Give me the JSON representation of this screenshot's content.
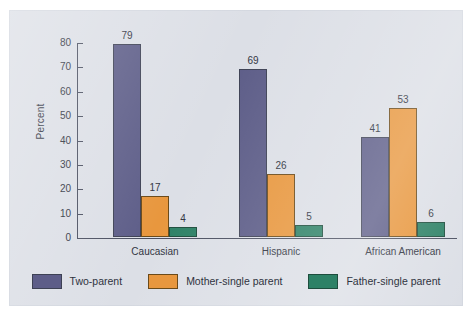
{
  "chart_data": {
    "type": "bar",
    "title": "",
    "xlabel": "",
    "ylabel": "Percent",
    "ylim": [
      0,
      80
    ],
    "yticks": [
      0,
      10,
      20,
      30,
      40,
      50,
      60,
      70,
      80
    ],
    "grid": false,
    "legend_position": "bottom",
    "categories": [
      "Caucasian",
      "Hispanic",
      "African American"
    ],
    "series": [
      {
        "name": "Two-parent",
        "color": "#5d5d88",
        "values": [
          79,
          69,
          41
        ]
      },
      {
        "name": "Mother-single parent",
        "color": "#e8973e",
        "values": [
          17,
          26,
          53
        ]
      },
      {
        "name": "Father-single parent",
        "color": "#2d8166",
        "values": [
          4,
          5,
          6
        ]
      }
    ],
    "data_labels": [
      [
        "79",
        "17",
        "4"
      ],
      [
        "69",
        "26",
        "5"
      ],
      [
        "41",
        "53",
        "6"
      ]
    ]
  },
  "figure": {
    "panel_background": "#dcdfe6",
    "axis_color": "#4a4f60",
    "text_color": "#2f3340"
  }
}
